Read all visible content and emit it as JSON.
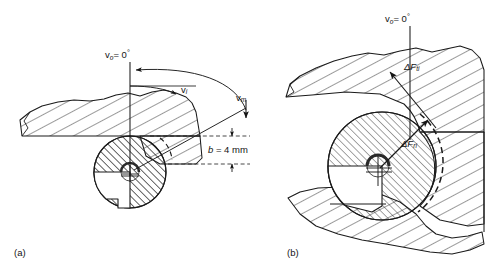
{
  "figure": {
    "type": "engineering-diagram",
    "panels": [
      {
        "id": "a",
        "label": "(a)",
        "labels": {
          "v_zero": {
            "symbol": "v",
            "subscript": "o",
            "equals": "= 0",
            "degree": "°"
          },
          "v_i": {
            "symbol": "v",
            "subscript": "i"
          },
          "v_m": {
            "symbol": "v",
            "subscript": "m"
          },
          "depth": {
            "symbol": "b",
            "value": "= 4 mm"
          }
        }
      },
      {
        "id": "b",
        "label": "(b)",
        "labels": {
          "v_zero": {
            "symbol": "v",
            "subscript": "o",
            "equals": "= 0",
            "degree": "°"
          },
          "f_ti": {
            "symbol": "ΔF",
            "subscript": "ti"
          },
          "f_ri": {
            "symbol": "ΔF",
            "subscript": "ri"
          }
        }
      }
    ],
    "colors": {
      "stroke": "#1a1a1a",
      "hatch": "#262626",
      "background": "#ffffff",
      "dash": "#1a1a1a"
    }
  }
}
